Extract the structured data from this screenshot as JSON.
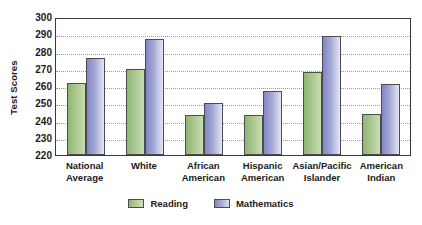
{
  "chart_data": {
    "type": "bar",
    "title": "",
    "xlabel": "",
    "ylabel": "Test Scores",
    "ylim": [
      220,
      300
    ],
    "ytick_step": 10,
    "yticks": [
      300,
      290,
      280,
      270,
      260,
      250,
      240,
      230,
      220
    ],
    "grid": true,
    "legend_position": "bottom",
    "categories": [
      "National Average",
      "White",
      "African American",
      "Hispanic American",
      "Asian/Pacific Islander",
      "American Indian"
    ],
    "category_lines": [
      [
        "National",
        "Average"
      ],
      [
        "White",
        ""
      ],
      [
        "African",
        "American"
      ],
      [
        "Hispanic",
        "American"
      ],
      [
        "Asian/Pacific",
        "Islander"
      ],
      [
        "American",
        "Indian"
      ]
    ],
    "series": [
      {
        "name": "Reading",
        "color": "#8fb573",
        "values": [
          262,
          270,
          243,
          243,
          268,
          244
        ]
      },
      {
        "name": "Mathematics",
        "color": "#8287c4",
        "values": [
          276,
          287,
          250,
          257,
          289,
          261
        ]
      }
    ]
  },
  "legend": {
    "items": [
      {
        "label": "Reading",
        "swatch": "reading"
      },
      {
        "label": "Mathematics",
        "swatch": "math"
      }
    ]
  },
  "colors": {
    "reading": "#8fb573",
    "mathematics": "#8287c4",
    "axis": "#3a3a3a",
    "gridline": "#9a9a9a",
    "text": "#1a1a1a",
    "background": "#ffffff"
  }
}
